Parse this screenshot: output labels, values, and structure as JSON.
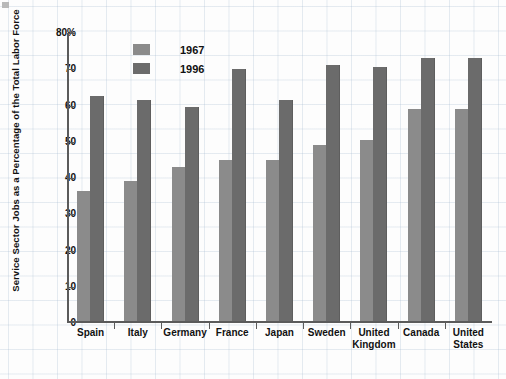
{
  "chart_data": {
    "type": "bar",
    "title": "",
    "xlabel": "",
    "ylabel": "Service Sector Jobs as a Percentage of the Total Labor Force",
    "ylim": [
      0,
      80
    ],
    "yticks": [
      0,
      10,
      20,
      30,
      40,
      50,
      60,
      70,
      80
    ],
    "ytick_labels": [
      "0",
      "10",
      "20",
      "30",
      "40",
      "50",
      "60",
      "70",
      "80%"
    ],
    "grid": true,
    "legend_position": "top-left-inside",
    "categories": [
      "Spain",
      "Italy",
      "Germany",
      "France",
      "Japan",
      "Sweden",
      "United Kingdom",
      "Canada",
      "United States"
    ],
    "series": [
      {
        "name": "1967",
        "color": "#8b8b8b",
        "values": [
          36,
          38.5,
          42.5,
          44.5,
          44.5,
          48.5,
          50,
          58.5,
          58.5
        ]
      },
      {
        "name": "1996",
        "color": "#6b6b6b",
        "values": [
          62,
          61,
          59,
          69.5,
          61,
          70.5,
          70,
          72.5,
          72.5
        ]
      }
    ]
  },
  "legend": {
    "items": [
      {
        "label": "1967"
      },
      {
        "label": "1996"
      }
    ]
  }
}
